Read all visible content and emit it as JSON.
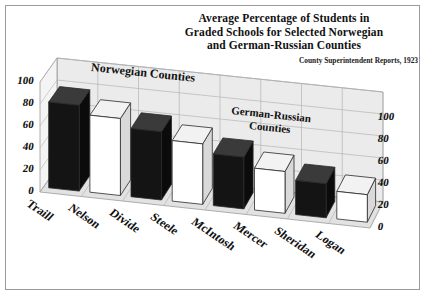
{
  "title": {
    "line1": "Average Percentage of Students in",
    "line2": "Graded Schools for Selected Norwegian",
    "line3": "and German-Russian Counties"
  },
  "subtitle": "County Superintendent Reports, 1923",
  "annotations": {
    "group1": "Norwegian Counties",
    "group2_line1": "German-Russian",
    "group2_line2": "Counties"
  },
  "axis": {
    "left_ticks": [
      "100",
      "80",
      "60",
      "40",
      "20",
      "0"
    ],
    "right_ticks": [
      "100",
      "80",
      "60",
      "40",
      "20",
      "0"
    ]
  },
  "chart_data": {
    "type": "bar",
    "title": "Average Percentage of Students in Graded Schools for Selected Norwegian and German-Russian Counties",
    "subtitle": "County Superintendent Reports, 1923",
    "xlabel": "",
    "ylabel": "",
    "ylim": [
      0,
      100
    ],
    "grid": true,
    "legend": "none",
    "categories": [
      "Traill",
      "Nelson",
      "Divide",
      "Steele",
      "McIntosh",
      "Mercer",
      "Sheridan",
      "Logan"
    ],
    "values": [
      78,
      70,
      62,
      55,
      47,
      38,
      31,
      25
    ],
    "bar_colors": [
      "#111111",
      "#ffffff",
      "#111111",
      "#ffffff",
      "#111111",
      "#ffffff",
      "#111111",
      "#ffffff"
    ],
    "groups": [
      {
        "name": "Norwegian Counties",
        "categories": [
          "Traill",
          "Nelson",
          "Divide",
          "Steele"
        ]
      },
      {
        "name": "German-Russian Counties",
        "categories": [
          "McIntosh",
          "Mercer",
          "Sheridan",
          "Logan"
        ]
      }
    ]
  }
}
